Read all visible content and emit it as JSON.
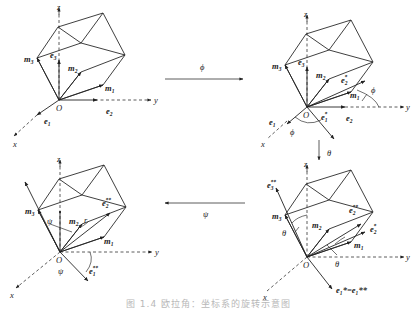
{
  "caption": "图 1.4  欧拉角：坐标系的旋转示意图",
  "transitions": {
    "phi": {
      "label": "ϕ",
      "direction": "right"
    },
    "theta": {
      "label": "θ",
      "direction": "down"
    },
    "psi": {
      "label": "ψ",
      "direction": "left"
    }
  },
  "panels": [
    {
      "id": "initial",
      "axes": {
        "x": "x",
        "y": "y",
        "z": "z",
        "origin": "O"
      },
      "vectors": {
        "m1": "m",
        "m1_sub": "1",
        "m2": "m",
        "m2_sub": "2",
        "m3": "m",
        "m3_sub": "3",
        "e1": "e",
        "e1_sub": "1",
        "e2": "e",
        "e2_sub": "2",
        "e3": "e",
        "e3_sub": "3"
      }
    },
    {
      "id": "after-phi",
      "axes": {
        "x": "x",
        "y": "y",
        "z": "z",
        "origin": "O"
      },
      "vectors": {
        "m1": "m",
        "m1_sub": "1",
        "m2": "m",
        "m2_sub": "2",
        "m3": "m",
        "m3_sub": "3",
        "e1": "e",
        "e1_sub": "1",
        "e2": "e",
        "e2_sub": "2",
        "e3": "e",
        "e3_sub": "3",
        "e1s": "e",
        "e1s_sub": "1",
        "e1s_sup": "*",
        "e2s": "e",
        "e2s_sub": "2",
        "e2s_sup": "*"
      },
      "angles": [
        "ϕ",
        "ϕ"
      ]
    },
    {
      "id": "after-theta",
      "axes": {
        "x": "x",
        "y": "y",
        "z": "z",
        "origin": "O"
      },
      "vectors": {
        "m1": "m",
        "m1_sub": "1",
        "m2": "m",
        "m2_sub": "2",
        "m3": "m",
        "m3_sub": "3",
        "e3ss": "e",
        "e3ss_sub": "3",
        "e3ss_sup": "**",
        "e2ss": "e",
        "e2ss_sub": "2",
        "e2ss_sup": "**",
        "e2s": "e",
        "e2s_sub": "2",
        "e2s_sup": "*",
        "e1eq": "e₁*=e₁**"
      },
      "angles": [
        "θ",
        "θ"
      ]
    },
    {
      "id": "after-psi",
      "axes": {
        "x": "x",
        "y": "y",
        "z": "z",
        "origin": "O"
      },
      "vectors": {
        "m1": "m",
        "m1_sub": "1",
        "m2": "m",
        "m2_sub": "2",
        "m3": "m",
        "m3_sub": "3",
        "e1ss": "e",
        "e1ss_sub": "1",
        "e1ss_sup": "**",
        "e2ss": "e",
        "e2ss_sub": "2",
        "e2ss_sup": "**",
        "r": "r"
      },
      "angles": [
        "ψ",
        "ψ"
      ]
    }
  ]
}
